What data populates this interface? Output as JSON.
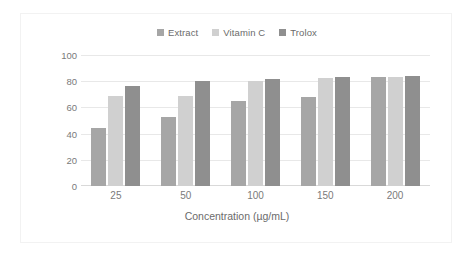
{
  "chart_data": {
    "type": "bar",
    "title": "",
    "subtitle": "",
    "xlabel": "Concentration (µg/mL)",
    "ylabel": "DPPH inhibition (%)",
    "categories": [
      "25",
      "50",
      "100",
      "150",
      "200"
    ],
    "ylim": [
      0,
      100
    ],
    "yticks": [
      "0",
      "20",
      "40",
      "60",
      "80",
      "100"
    ],
    "grid": true,
    "legend_position": "top-center",
    "series": [
      {
        "name": "Extract",
        "color": "#a6a6a6",
        "values": [
          44,
          53,
          65,
          68,
          83
        ]
      },
      {
        "name": "Vitamin C",
        "color": "#d0d0d0",
        "values": [
          69,
          69,
          80,
          82.5,
          83.5
        ]
      },
      {
        "name": "Trolox",
        "color": "#8f8f8f",
        "values": [
          76,
          80.5,
          82,
          83,
          84
        ]
      }
    ],
    "annotations": []
  },
  "legend": {
    "items": [
      {
        "label": "Extract",
        "swatch_color": "#a6a6a6"
      },
      {
        "label": "Vitamin C",
        "swatch_color": "#d0d0d0"
      },
      {
        "label": "Trolox",
        "swatch_color": "#8f8f8f"
      }
    ]
  },
  "axes": {
    "y_title": "DPPH inhibition (%)",
    "x_title": "Concentration (µg/mL)",
    "y_ticks": [
      "100",
      "80",
      "60",
      "40",
      "20",
      "0"
    ],
    "x_ticks": [
      "25",
      "50",
      "100",
      "150",
      "200"
    ]
  },
  "style": {
    "plot_background": "#ffffff",
    "gridline_color": "#e8e8e8",
    "axis_text_color": "#7a7a7a",
    "frame_color": "#f2f2f2"
  }
}
